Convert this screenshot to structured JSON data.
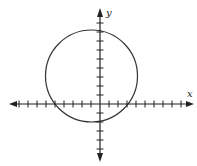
{
  "figure": {
    "type": "coordinate-plane-with-circle",
    "x_axis_label": "x",
    "y_axis_label": "y",
    "x_ticks": [
      -10,
      -9,
      -8,
      -7,
      -6,
      -5,
      -4,
      -3,
      -2,
      -1,
      1,
      2,
      3,
      4,
      5,
      6,
      7,
      8,
      9
    ],
    "y_ticks": [
      -6,
      -5,
      -4,
      -3,
      -2,
      -1,
      1,
      2,
      3,
      4,
      5,
      6,
      7,
      8
    ],
    "circle": {
      "center": [
        -1,
        3
      ],
      "radius": 5
    },
    "colors": {
      "axis": "#222222",
      "circle": "#333333"
    }
  }
}
